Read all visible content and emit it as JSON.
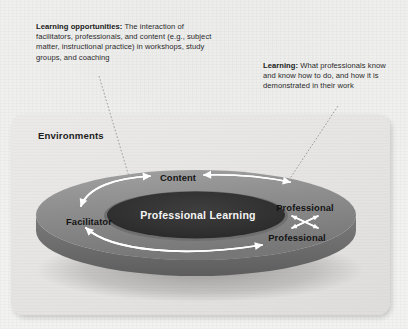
{
  "callouts": [
    {
      "id": "learning-opportunities",
      "term": "Learning opportunities:",
      "text": " The interaction of facilitators, professionals, and content (e.g., subject matter, instructional practice) in workshops, study groups, and coaching"
    },
    {
      "id": "learning",
      "term": "Learning:",
      "text": " What professionals know and know how to do, and how it is demonstrated in their work"
    }
  ],
  "panel": {
    "title": "Environments"
  },
  "diagram": {
    "core_label": "Professional Learning",
    "ring_labels": {
      "content": "Content",
      "facilitator": "Facilitator",
      "professional_upper": "Professional",
      "professional_lower": "Professional"
    }
  },
  "colors": {
    "page_background": "#f2f2f1",
    "panel_background": "#e6e5e3",
    "ring_top": "#8d8d8d",
    "ring_side": "#6e6e6e",
    "ring_shadow": "#7a7a7a",
    "core": "#333333",
    "arrow": "#ffffff",
    "text_dark": "#1a1a1a",
    "leader_line": "#9a9a9a"
  }
}
